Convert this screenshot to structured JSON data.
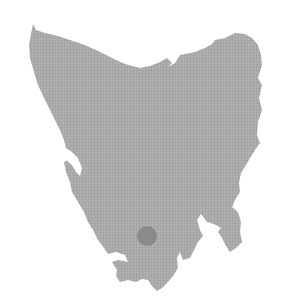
{
  "map": {
    "region": "Tasmania",
    "land_color": "#a9a9a9",
    "water_color": "#ffffff",
    "marker": {
      "type": "circle",
      "cx": 147,
      "cy": 236,
      "r": 10,
      "color": "#8a8a8a"
    }
  }
}
